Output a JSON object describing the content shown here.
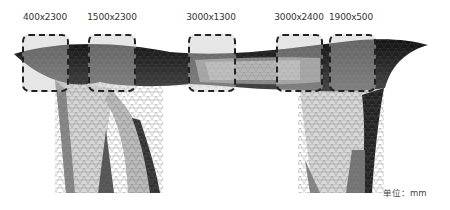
{
  "diagram": {
    "type": "structural mesh elevation",
    "annotations": [
      {
        "label": "400x2300",
        "cx": 45,
        "box": {
          "x": 22,
          "y": 34,
          "w": 47,
          "h": 58
        }
      },
      {
        "label": "1500x2300",
        "cx": 112,
        "box": {
          "x": 88,
          "y": 34,
          "w": 48,
          "h": 58
        }
      },
      {
        "label": "3000x1300",
        "cx": 211,
        "box": {
          "x": 188,
          "y": 34,
          "w": 48,
          "h": 58
        }
      },
      {
        "label": "3000x2400",
        "cx": 299,
        "box": {
          "x": 276,
          "y": 34,
          "w": 47,
          "h": 58
        }
      },
      {
        "label": "1900x500",
        "cx": 351,
        "box": {
          "x": 329,
          "y": 34,
          "w": 47,
          "h": 58
        }
      }
    ],
    "unit_label": "单位：mm"
  }
}
